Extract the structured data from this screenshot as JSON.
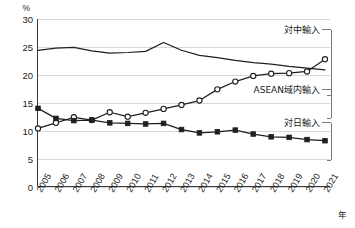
{
  "chart_data": {
    "type": "line",
    "title": "",
    "subtitle": "",
    "xlabel": "年",
    "ylabel": "%",
    "unit": "%",
    "xlim": [
      2005,
      2021
    ],
    "ylim": [
      0,
      30
    ],
    "yticks": [
      0,
      5,
      10,
      15,
      20,
      25,
      30
    ],
    "grid": true,
    "legend_position": "inline-right-callouts",
    "categories": [
      "2005",
      "2006",
      "2007",
      "2008",
      "2009",
      "2010",
      "2011",
      "2012",
      "2013",
      "2014",
      "2015",
      "2016",
      "2017",
      "2018",
      "2019",
      "2020",
      "2021"
    ],
    "series": [
      {
        "name": "ASEAN域内輸入",
        "marker": "none",
        "values": [
          24.4,
          24.8,
          24.9,
          24.3,
          23.9,
          24.0,
          24.2,
          25.8,
          24.4,
          23.5,
          23.1,
          22.6,
          22.2,
          21.9,
          21.5,
          21.2,
          20.9
        ]
      },
      {
        "name": "対中輸入",
        "marker": "open-circle",
        "values": [
          10.4,
          11.4,
          12.4,
          11.9,
          13.3,
          12.5,
          13.2,
          13.9,
          14.6,
          15.4,
          17.4,
          18.8,
          19.8,
          20.2,
          20.3,
          20.6,
          22.8
        ]
      },
      {
        "name": "対日輸入",
        "marker": "filled-square",
        "values": [
          14.0,
          12.2,
          11.8,
          11.9,
          11.4,
          11.3,
          11.2,
          11.3,
          10.2,
          9.6,
          9.8,
          10.1,
          9.4,
          8.9,
          8.8,
          8.4,
          8.2
        ]
      }
    ],
    "annotations": [
      {
        "label": "対中輸入",
        "series": "対中輸入"
      },
      {
        "label": "ASEAN域内輸入",
        "series": "ASEAN域内輸入"
      },
      {
        "label": "対日輸入",
        "series": "対日輸入"
      }
    ]
  },
  "colors": {
    "line": "#1f1f1f",
    "grid": "#d8d8d8",
    "axis": "#3a3a3a",
    "background": "#ffffff",
    "text": "#1a1a1a"
  }
}
